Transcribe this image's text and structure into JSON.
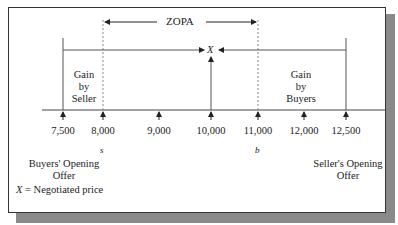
{
  "diagram": {
    "zopa_label": "ZOPA",
    "x_marker": "X",
    "gain_seller": [
      "Gain",
      "by",
      "Seller"
    ],
    "gain_buyers": [
      "Gain",
      "by",
      "Buyers"
    ],
    "ticks": [
      {
        "value": 7500,
        "label": "7,500",
        "x": 63
      },
      {
        "value": 8000,
        "label": "8,000",
        "x": 103
      },
      {
        "value": 9000,
        "label": "9,000",
        "x": 159
      },
      {
        "value": 10000,
        "label": "10,000",
        "x": 211
      },
      {
        "value": 11000,
        "label": "11,000",
        "x": 258
      },
      {
        "value": 12000,
        "label": "12,000",
        "x": 304
      },
      {
        "value": 12500,
        "label": "12,500",
        "x": 346
      }
    ],
    "s_label": "s",
    "b_label": "b",
    "buyers_opening_offer": [
      "Buyers' Opening",
      "Offer"
    ],
    "sellers_opening_offer": [
      "Seller's Opening",
      "Offer"
    ],
    "legend_x": "X",
    "legend_text": " = Negotiated price",
    "colors": {
      "line": "#333333",
      "dashed": "#777777",
      "shadow": "#8a8a8a"
    }
  }
}
